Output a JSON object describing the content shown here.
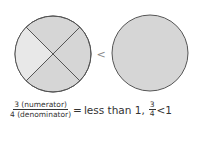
{
  "diagram": {
    "left_circle": {
      "parts": 4,
      "shaded_lighter_part": "left",
      "fill": "#d4d4d4",
      "light_fill": "#e6e6e6",
      "stroke": "#555555"
    },
    "comparison_symbol": "<",
    "right_circle": {
      "parts": 1,
      "fill": "#d4d4d4",
      "stroke": "#555555"
    }
  },
  "equation": {
    "numerator_label": "3 (numerator)",
    "denominator_label": "4 (denominator)",
    "equals": "=",
    "result_text": "less than 1,",
    "frac_num": "3",
    "frac_den": "4",
    "compare": "<",
    "compare_value": "1"
  }
}
